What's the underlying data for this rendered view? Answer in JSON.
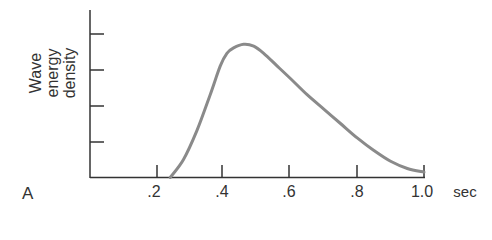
{
  "chart_data": {
    "type": "line",
    "title": "",
    "panel_label": "A",
    "xlabel": "sec",
    "ylabel": [
      "Wave",
      "energy",
      "density"
    ],
    "xlim": [
      0,
      1.0
    ],
    "ylim": [
      0,
      4.6
    ],
    "x_ticks": [
      ".2",
      ".4",
      ".6",
      ".8",
      "1.0"
    ],
    "y_ticks_count": 4,
    "grid": false,
    "legend": null,
    "series": [
      {
        "name": "Wave energy density",
        "x": [
          0.24,
          0.28,
          0.32,
          0.36,
          0.39,
          0.41,
          0.43,
          0.46,
          0.49,
          0.52,
          0.56,
          0.6,
          0.65,
          0.7,
          0.75,
          0.8,
          0.85,
          0.9,
          0.95,
          1.0
        ],
        "y": [
          0.0,
          0.5,
          1.3,
          2.3,
          3.1,
          3.45,
          3.6,
          3.7,
          3.65,
          3.45,
          3.1,
          2.75,
          2.3,
          1.9,
          1.5,
          1.1,
          0.75,
          0.45,
          0.25,
          0.15
        ]
      }
    ],
    "line_color": "#8a8a8a"
  },
  "labels": {
    "panel": "A",
    "xunit": "sec",
    "x1": ".2",
    "x2": ".4",
    "x3": ".6",
    "x4": ".8",
    "x5": "1.0",
    "y_line1": "Wave",
    "y_line2": "energy",
    "y_line3": "density"
  }
}
